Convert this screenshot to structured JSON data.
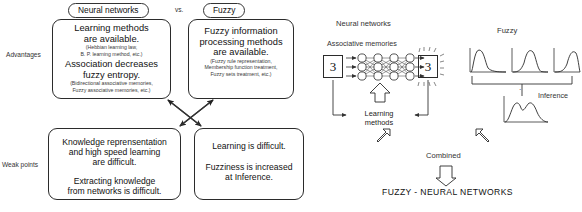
{
  "figure": {
    "left_panel": {
      "row_labels": [
        {
          "id": "advantages",
          "text": "Advantages"
        },
        {
          "id": "weak-points",
          "text": "Weak points"
        }
      ],
      "columns": [
        {
          "id": "neural-networks",
          "title": "Neural networks"
        },
        {
          "id": "fuzzy",
          "title": "Fuzzy"
        }
      ],
      "vs_label": "vs.",
      "cells": [
        {
          "id": "nn-advantages",
          "column": "neural-networks",
          "row": "advantages",
          "lines": [
            {
              "text": "Learning methods",
              "style": "large"
            },
            {
              "text": "are available.",
              "style": "large"
            },
            {
              "text": "(Hebbian learning law,",
              "style": "note"
            },
            {
              "text": "B. P. learning method, etc.)",
              "style": "note"
            },
            {
              "text": "Association decreases",
              "style": "large"
            },
            {
              "text": "fuzzy entropy.",
              "style": "large"
            },
            {
              "text": "(Bidirectional associative memories,",
              "style": "note"
            },
            {
              "text": "Fuzzy associative memories, etc.)",
              "style": "note"
            }
          ]
        },
        {
          "id": "fuzzy-advantages",
          "column": "fuzzy",
          "row": "advantages",
          "lines": [
            {
              "text": "Fuzzy information",
              "style": "large"
            },
            {
              "text": "processing methods",
              "style": "large"
            },
            {
              "text": "are available.",
              "style": "large"
            },
            {
              "text": "(Fuzzy rule representation,",
              "style": "note"
            },
            {
              "text": "Membership function treatment,",
              "style": "note"
            },
            {
              "text": "Fuzzy sets treatment, etc.)",
              "style": "note"
            }
          ]
        },
        {
          "id": "nn-weak-points",
          "column": "neural-networks",
          "row": "weak-points",
          "lines": [
            {
              "text": "Knowledge reprensentation",
              "style": "large"
            },
            {
              "text": "and high speed learning",
              "style": "large"
            },
            {
              "text": "are difficult.",
              "style": "large"
            },
            {
              "text": "",
              "style": "gap"
            },
            {
              "text": "Extracting knowledge",
              "style": "large"
            },
            {
              "text": "from networks is difficult.",
              "style": "large"
            }
          ]
        },
        {
          "id": "fuzzy-weak-points",
          "column": "fuzzy",
          "row": "weak-points",
          "lines": [
            {
              "text": "Learning is difficult.",
              "style": "large"
            },
            {
              "text": "",
              "style": "gap"
            },
            {
              "text": "Fuzziness is increased",
              "style": "large"
            },
            {
              "text": "at Inference.",
              "style": "large"
            }
          ]
        }
      ]
    },
    "right_panel": {
      "nn_section": {
        "title": "Neural networks",
        "subtitle": "Associative memories",
        "input_digit": "3",
        "output_digit": "3",
        "learning_label_line1": "Learning",
        "learning_label_line2": "methods",
        "network": {
          "rows": 3,
          "cols": 4
        }
      },
      "fuzzy_section": {
        "title": "Fuzzy",
        "inference_label": "Inference",
        "membership_curves": 3,
        "operator": "."
      },
      "combined_label": "Combined",
      "result_label": "FUZZY - NEURAL NETWORKS"
    }
  },
  "colors": {
    "ink": "#1a1a1a",
    "stroke": "#2b2b2b",
    "note": "#3a3a3a",
    "paper": "#ffffff"
  }
}
